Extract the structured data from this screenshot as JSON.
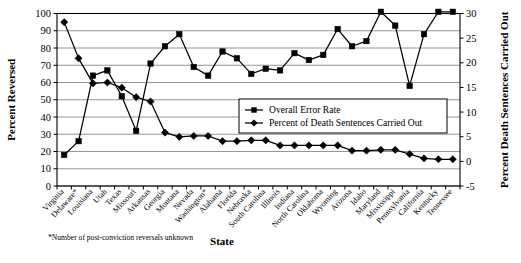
{
  "chart_data": {
    "type": "line",
    "title": "",
    "xlabel": "State",
    "ylabel": "Percent Reversed",
    "y2label": "Percent Death Sentences Carried Out",
    "ylim": [
      0,
      100
    ],
    "y2lim": [
      -5,
      30
    ],
    "yticks": [
      0,
      10,
      20,
      30,
      40,
      50,
      60,
      70,
      80,
      90,
      100
    ],
    "y2ticks": [
      -5,
      0,
      5,
      10,
      15,
      20,
      25,
      30
    ],
    "grid": true,
    "legend_position": "center-right",
    "categories": [
      "Virginia",
      "Delaware*",
      "Louisiana",
      "Utah",
      "Texas",
      "Missouri",
      "Arkansas",
      "Georgia",
      "Montana",
      "Nevada",
      "Washington*",
      "Alabama",
      "Florida",
      "Nebraska",
      "South Carolina",
      "Illinois",
      "Indiana",
      "North Carolina",
      "Oklahoma",
      "Wyoming",
      "Arizona",
      "Idaho",
      "Maryland",
      "Mississippi",
      "Pennsylvania",
      "California",
      "Kentucky",
      "Tennessee"
    ],
    "series": [
      {
        "name": "Overall Error Rate",
        "marker": "square",
        "axis": "left",
        "values": [
          18,
          26,
          64,
          67,
          52,
          32,
          71,
          81,
          88,
          69,
          64,
          78,
          74,
          65,
          68,
          67,
          77,
          73,
          76,
          91,
          81,
          84,
          101,
          93,
          58,
          88,
          101,
          101
        ]
      },
      {
        "name": "Percent of Death Sentences Carried Out",
        "marker": "diamond",
        "axis": "right",
        "values": [
          95,
          74,
          59.5,
          60,
          57,
          51.5,
          49,
          31,
          28.5,
          29,
          29,
          26,
          26,
          26.5,
          26.5,
          23.5,
          23.5,
          23.5,
          23.5,
          23.5,
          20.5,
          20.5,
          21,
          21,
          18.5,
          16,
          15.5,
          15.5
        ]
      }
    ],
    "footnote": "*Number of post-conviction reversals unknown"
  },
  "legend": {
    "items": [
      {
        "label": "Overall Error Rate",
        "marker": "square"
      },
      {
        "label": "Percent of Death Sentences Carried Out",
        "marker": "diamond"
      }
    ]
  }
}
